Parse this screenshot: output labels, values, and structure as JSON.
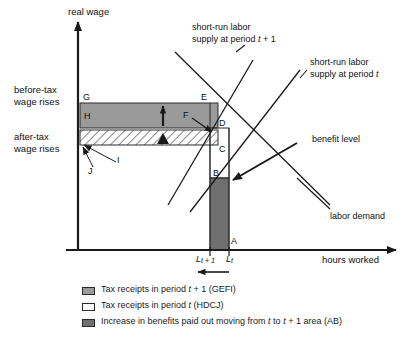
{
  "figure": {
    "axes": {
      "y_label": "real wage",
      "x_label": "hours worked"
    },
    "side_labels": {
      "before_tax": "before-tax\nwage rises",
      "before_tax_line1": "before-tax",
      "before_tax_line2": "wage rises",
      "after_tax_line1": "after-tax",
      "after_tax_line2": "wage rises"
    },
    "curve_labels": {
      "supply_t1_line1": "short-run labor",
      "supply_t1_line2": "supply at period t + 1",
      "supply_t_line1": "short-run labor",
      "supply_t_line2": "supply at period t",
      "demand": "labor demand",
      "benefit": "benefit level"
    },
    "tick_labels": {
      "l_t1_base": "L",
      "l_t1_sub": "t + 1",
      "l_t_base": "L",
      "l_t_sub": "t"
    },
    "points": {
      "A": "A",
      "B": "B",
      "C": "C",
      "D": "D",
      "E": "E",
      "F": "F",
      "G": "G",
      "H": "H",
      "I": "I",
      "J": "J"
    }
  },
  "legend": {
    "items": [
      {
        "swatch": "gefi",
        "label": "Tax receipts in period t + 1 (GEFI)"
      },
      {
        "swatch": "hdcj",
        "label": "Tax receipts in period t (HDCJ)"
      },
      {
        "swatch": "ab",
        "label": "Increase in benefits paid out moving from t to t + 1 area (AB)"
      }
    ]
  },
  "colors": {
    "gefi_fill": "#9a9a9a",
    "hdcj_fill": "#ffffff",
    "ab_fill": "#6f6f6f",
    "line": "#1a1a1a"
  }
}
